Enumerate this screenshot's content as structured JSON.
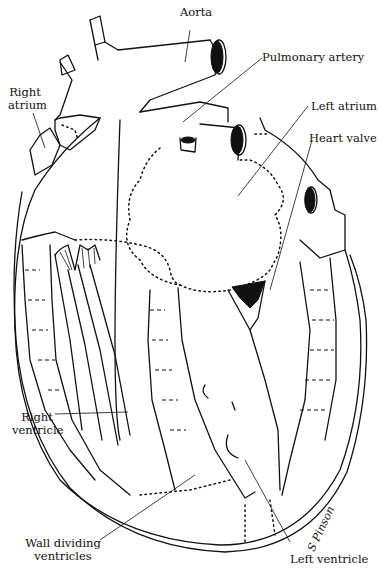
{
  "diagram": {
    "labels": {
      "aorta": "Aorta",
      "pulmonary_artery": "Pulmonary artery",
      "right_atrium_line1": "Right",
      "right_atrium_line2": "atrium",
      "left_atrium": "Left atrium",
      "heart_valve": "Heart valve",
      "right_ventricle_line1": "Right",
      "right_ventricle_line2": "ventricle",
      "wall_line1": "Wall dividing",
      "wall_line2": "ventricles",
      "left_ventricle": "Left ventricle"
    },
    "signature": "S Pinson",
    "colors": {
      "ink": "#111111",
      "background": "#ffffff"
    }
  }
}
